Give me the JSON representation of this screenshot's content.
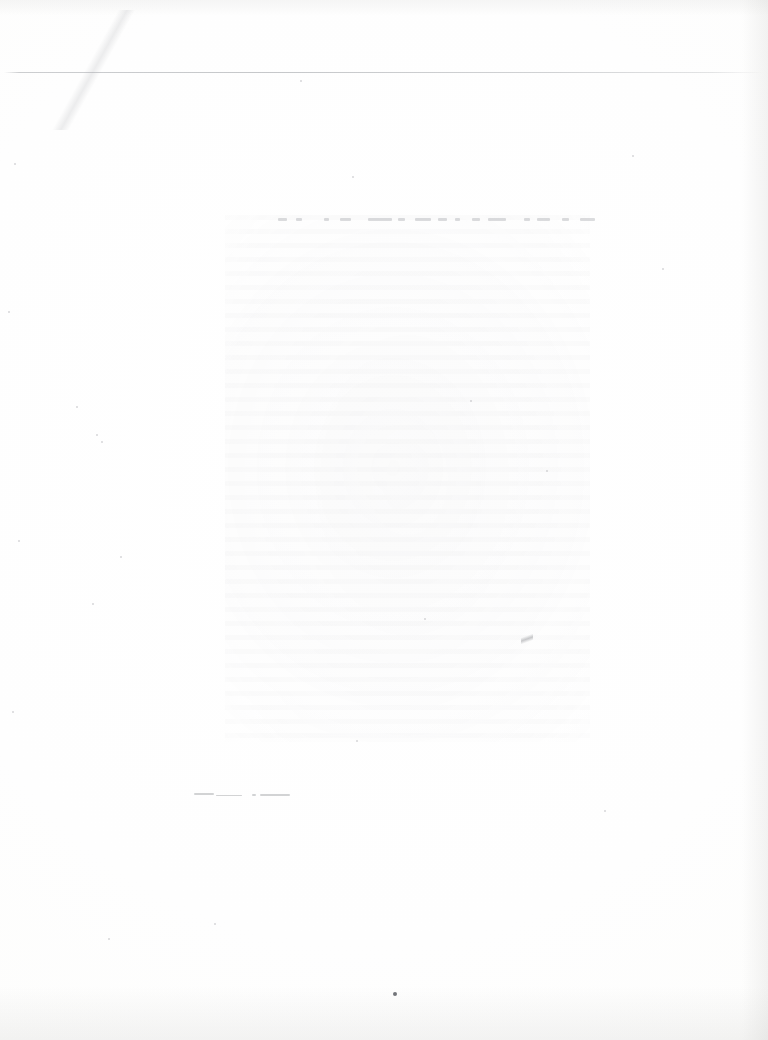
{
  "document": {
    "medium": "scanned paper page",
    "condition": "blank appearance; ink almost entirely faded, no legible characters",
    "page_width_px": 768,
    "page_height_px": 1040,
    "background_color": "#fefefe",
    "paper_tone": "near-white, faintly warm",
    "legible_text": "",
    "readable_content_present": false
  },
  "features": {
    "header_rule": {
      "name": "horizontal rule",
      "color": "#a3a6aa",
      "y_px": 72,
      "x_start_px": 4,
      "x_end_px": 764,
      "thickness_px": 1,
      "description": "very light full-width line near the top of the page"
    },
    "text_block_ghost": {
      "name": "faded text block",
      "x_px": 225,
      "y_px": 215,
      "width_px": 365,
      "height_px": 527,
      "ink_color": "#b0b0b4",
      "description": "mottled rectangular area where body text once sat; characters unresolvable"
    },
    "heading_ghost": {
      "name": "faded heading line",
      "y_px": 220,
      "x_start_px": 250,
      "x_end_px": 595,
      "description": "row of faint word-shaped marks at the top of the text block"
    },
    "smudges": {
      "name": "lower-left smudge marks",
      "y_px": 795,
      "x_start_px": 195,
      "x_end_px": 290,
      "description": "two short faint horizontal smears"
    },
    "crease": {
      "name": "diagonal crease",
      "region": "upper-left corner",
      "description": "faint diagonal fold line across the top-left margin"
    },
    "scratch": {
      "name": "diagonal scratch",
      "x_px": 527,
      "y_px": 640,
      "description": "short dark diagonal scratch within the text area"
    },
    "dark_speck": {
      "name": "dark speck",
      "x_px": 395,
      "y_px": 994,
      "color": "#4e5056",
      "description": "small isolated dark dot near the bottom of the page"
    },
    "edge_shading": {
      "name": "scan edge shading",
      "edges": [
        "right",
        "bottom",
        "top"
      ],
      "description": "slight gray gradient along the scan borders"
    },
    "foxing_specks": {
      "name": "dust and foxing specks",
      "color": "#96969c",
      "description": "scattered faint dots across the margins"
    }
  }
}
